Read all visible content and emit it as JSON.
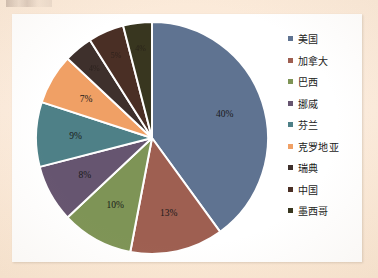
{
  "page": {
    "background_color": "#fbead9",
    "panel_color": "#ffffff"
  },
  "chart_data": {
    "type": "pie",
    "title": "",
    "legend_position": "right",
    "categories": [
      "美国",
      "加拿大",
      "巴西",
      "挪威",
      "芬兰",
      "克罗地亚",
      "瑞典",
      "中国",
      "墨西哥"
    ],
    "values": [
      40,
      13,
      10,
      8,
      9,
      7,
      4,
      5,
      4
    ],
    "labels": [
      "40%",
      "13%",
      "10%",
      "8%",
      "9%",
      "7%",
      "4%",
      "5%",
      "4%"
    ],
    "colors": [
      "#5f7391",
      "#9e5f51",
      "#7e9456",
      "#665570",
      "#4e8087",
      "#f0a065",
      "#3e302c",
      "#4a2f25",
      "#38361f"
    ],
    "units": "%",
    "start_angle_deg": 0,
    "direction": "clockwise"
  },
  "legend": {
    "items": [
      {
        "label": "美国",
        "color": "#5f7391"
      },
      {
        "label": "加拿大",
        "color": "#9e5f51"
      },
      {
        "label": "巴西",
        "color": "#7e9456"
      },
      {
        "label": "挪威",
        "color": "#665570"
      },
      {
        "label": "芬兰",
        "color": "#4e8087"
      },
      {
        "label": "克罗地亚",
        "color": "#f0a065"
      },
      {
        "label": "瑞典",
        "color": "#3e302c"
      },
      {
        "label": "中国",
        "color": "#4a2f25"
      },
      {
        "label": "墨西哥",
        "color": "#38361f"
      }
    ]
  }
}
